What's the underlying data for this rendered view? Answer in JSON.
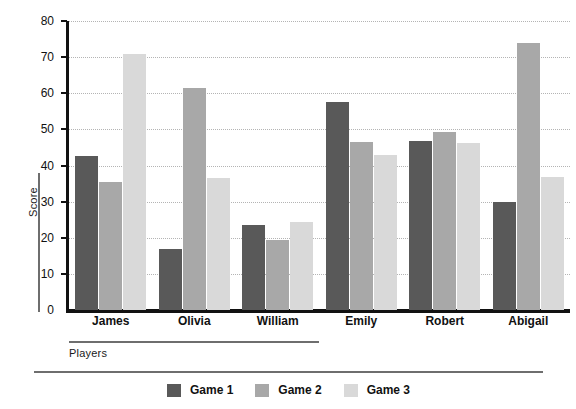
{
  "chart_data": {
    "type": "bar",
    "title": "",
    "xlabel": "Players",
    "ylabel": "Score",
    "categories": [
      "James",
      "Olivia",
      "William",
      "Emily",
      "Robert",
      "Abigail"
    ],
    "series": [
      {
        "name": "Game 1",
        "color": "#595959",
        "values": [
          42.5,
          17.0,
          23.5,
          57.5,
          46.8,
          30.0
        ]
      },
      {
        "name": "Game 2",
        "color": "#a8a8a8",
        "values": [
          35.5,
          61.5,
          19.3,
          46.5,
          49.2,
          73.8
        ]
      },
      {
        "name": "Game 3",
        "color": "#d9d9d9",
        "values": [
          70.8,
          36.5,
          24.5,
          43.0,
          46.3,
          36.8
        ]
      }
    ],
    "ylim": [
      0,
      80
    ],
    "yticks": [
      0,
      10,
      20,
      30,
      40,
      50,
      60,
      70,
      80
    ],
    "ytick_labels": [
      "0",
      "10",
      "20",
      "30",
      "40",
      "50",
      "60",
      "70",
      "80"
    ],
    "grid": true,
    "grid_style": "dotted",
    "legend_position": "bottom",
    "axis_color": "#111111",
    "background": "#ffffff"
  }
}
